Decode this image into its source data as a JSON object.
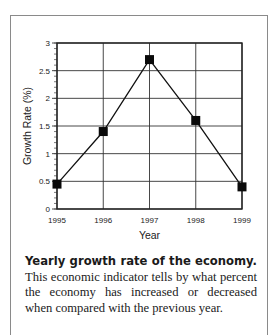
{
  "chart_data": {
    "type": "line",
    "title": "",
    "xlabel": "Year",
    "ylabel": "Growth Rate (%)",
    "categories": [
      "1995",
      "1996",
      "1997",
      "1998",
      "1999"
    ],
    "series": [
      {
        "name": "Growth Rate",
        "values": [
          0.45,
          1.4,
          2.7,
          1.6,
          0.4
        ],
        "marker": "square"
      }
    ],
    "ylim": [
      0,
      3
    ],
    "yticks": [
      "0",
      "0.5",
      "1",
      "1.5",
      "2",
      "2.5",
      "3"
    ],
    "grid": true,
    "legend": null
  },
  "caption": {
    "bold": "Yearly growth rate of the economy.",
    "text": " This economic indicator tells by what percent the economy has increased or decreased when compared with the previous year."
  }
}
